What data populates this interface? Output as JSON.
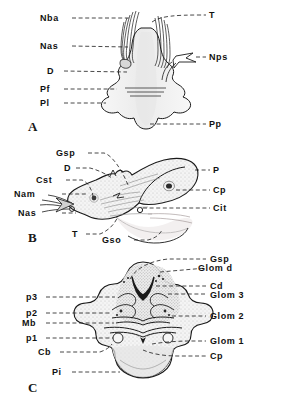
{
  "figure": {
    "type": "anatomical-line-drawing",
    "background_color": "#ffffff",
    "ink_color": "#1a1a1a",
    "fill_tone": "#f2f2f2",
    "stipple_tone": "#cfcfcf",
    "panels": [
      {
        "letter": "A",
        "labels_left": [
          {
            "text": "Nba"
          },
          {
            "text": "Nas"
          },
          {
            "text": "D"
          },
          {
            "text": "Pf"
          },
          {
            "text": "Pl"
          }
        ],
        "labels_right": [
          {
            "text": "T"
          },
          {
            "text": "Nps"
          },
          {
            "text": "Pp"
          }
        ]
      },
      {
        "letter": "B",
        "labels_left": [
          {
            "text": "Gsp"
          },
          {
            "text": "D"
          },
          {
            "text": "Cst"
          },
          {
            "text": "Nam"
          },
          {
            "text": "Nas"
          },
          {
            "text": "T"
          },
          {
            "text": "Gso"
          }
        ],
        "labels_right": [
          {
            "text": "P"
          },
          {
            "text": "Cp"
          },
          {
            "text": "Cit"
          }
        ]
      },
      {
        "letter": "C",
        "labels_left": [
          {
            "text": "p3"
          },
          {
            "text": "p2"
          },
          {
            "text": "Mb"
          },
          {
            "text": "p1"
          },
          {
            "text": "Cb"
          },
          {
            "text": "Pi"
          }
        ],
        "labels_right": [
          {
            "text": "Gsp"
          },
          {
            "text": "Glom d"
          },
          {
            "text": "Cd"
          },
          {
            "text": "Glom 3"
          },
          {
            "text": "Glom 2"
          },
          {
            "text": "Glom 1"
          },
          {
            "text": "Cp"
          }
        ]
      }
    ]
  }
}
